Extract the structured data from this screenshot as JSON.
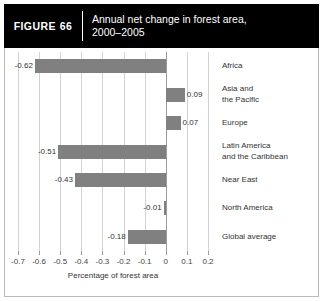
{
  "header": {
    "figure_label": "FIGURE",
    "figure_number": "66",
    "title_line1": "Annual net change in forest area,",
    "title_line2": "2000–2005"
  },
  "chart_data": {
    "type": "bar",
    "orientation": "horizontal",
    "title": "Annual net change in forest area, 2000–2005",
    "xlabel": "Percentage of forest area",
    "ylabel": "",
    "xlim": [
      -0.7,
      0.2
    ],
    "xticks": [
      "-0.7",
      "-0.6",
      "-0.5",
      "-0.4",
      "-0.3",
      "-0.2",
      "-0.1",
      "0",
      "0.1",
      "0.2"
    ],
    "xtick_values": [
      -0.7,
      -0.6,
      -0.5,
      -0.4,
      -0.3,
      -0.2,
      -0.1,
      0,
      0.1,
      0.2
    ],
    "grid": true,
    "legend": "none",
    "bar_color": "#808080",
    "categories": [
      "Africa",
      "Asia and the Pacific",
      "Europe",
      "Latin America and the Caribbean",
      "Near East",
      "North America",
      "Global average"
    ],
    "values": [
      -0.62,
      0.09,
      0.07,
      -0.51,
      -0.43,
      -0.01,
      -0.18
    ],
    "data_labels": [
      "-0.62",
      "0.09",
      "0.07",
      "-0.51",
      "-0.43",
      "-0.01",
      "-0.18"
    ],
    "category_label_lines": [
      [
        "Africa"
      ],
      [
        "Asia and",
        "the Pacific"
      ],
      [
        "Europe"
      ],
      [
        "Latin America",
        "and the Caribbean"
      ],
      [
        "Near East"
      ],
      [
        "North America"
      ],
      [
        "Global average"
      ]
    ]
  }
}
